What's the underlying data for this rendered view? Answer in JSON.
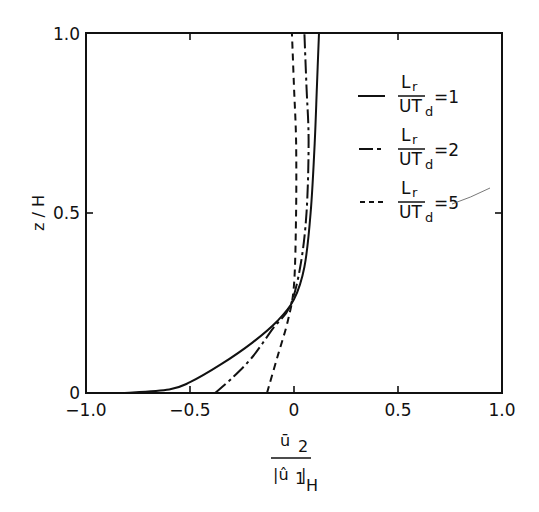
{
  "chart_data": {
    "type": "line",
    "title": "",
    "xlabel": "ū2 / |û1|_H",
    "xlabel_parts": {
      "numerator": "ū",
      "numerator_sub": "2",
      "denominator": "|û",
      "denominator_sub": "1",
      "denominator_close": "|",
      "denominator_sub2": "H"
    },
    "ylabel": "z / H",
    "xlim": [
      -1.0,
      1.0
    ],
    "ylim": [
      0,
      1.0
    ],
    "grid": false,
    "legend_position": "upper right (inside)",
    "x_ticks": [
      -1.0,
      -0.5,
      0,
      0.5,
      1.0
    ],
    "x_tick_labels": [
      "−1.0",
      "−0.5",
      "0",
      "0.5",
      "1.0"
    ],
    "y_ticks": [
      0,
      0.5,
      1.0
    ],
    "y_tick_labels": [
      "0",
      "0.5",
      "1.0"
    ],
    "series": [
      {
        "name": "Lr/UTd = 1",
        "style": "solid",
        "x": [
          -0.82,
          -0.6,
          -0.5,
          -0.35,
          -0.2,
          -0.08,
          0.0,
          0.05,
          0.08,
          0.1,
          0.11,
          0.12
        ],
        "y": [
          0.0,
          0.01,
          0.03,
          0.08,
          0.14,
          0.2,
          0.26,
          0.35,
          0.5,
          0.7,
          0.85,
          1.0
        ]
      },
      {
        "name": "Lr/UTd = 2",
        "style": "dash-dot",
        "x": [
          -0.38,
          -0.3,
          -0.2,
          -0.1,
          -0.02,
          0.03,
          0.06,
          0.07,
          0.06,
          0.05
        ],
        "y": [
          0.0,
          0.04,
          0.1,
          0.18,
          0.24,
          0.35,
          0.5,
          0.7,
          0.85,
          1.0
        ]
      },
      {
        "name": "Lr/UTd = 5",
        "style": "dashed",
        "x": [
          -0.13,
          -0.08,
          -0.03,
          0.0,
          0.01,
          0.01,
          0.0,
          -0.01
        ],
        "y": [
          0.0,
          0.1,
          0.2,
          0.3,
          0.5,
          0.7,
          0.85,
          1.0
        ]
      }
    ]
  },
  "legend": [
    {
      "num": "L",
      "num_sub": "r",
      "den": "UT",
      "den_sub": "d",
      "value": "=1"
    },
    {
      "num": "L",
      "num_sub": "r",
      "den": "UT",
      "den_sub": "d",
      "value": "=2"
    },
    {
      "num": "L",
      "num_sub": "r",
      "den": "UT",
      "den_sub": "d",
      "value": "=5"
    }
  ]
}
